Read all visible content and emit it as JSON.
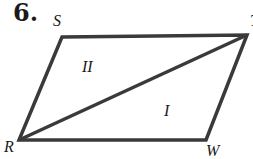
{
  "problem": {
    "number": "6.",
    "vertices": [
      {
        "label": "S",
        "x": 62,
        "y": 37
      },
      {
        "label": "T",
        "x": 247,
        "y": 35
      },
      {
        "label": "W",
        "x": 206,
        "y": 140
      },
      {
        "label": "R",
        "x": 19,
        "y": 140
      }
    ],
    "diagonal": {
      "from": "R",
      "to": "T"
    },
    "regions": [
      {
        "label": "II"
      },
      {
        "label": "I"
      }
    ],
    "stroke_color": "#3a3a3a"
  }
}
